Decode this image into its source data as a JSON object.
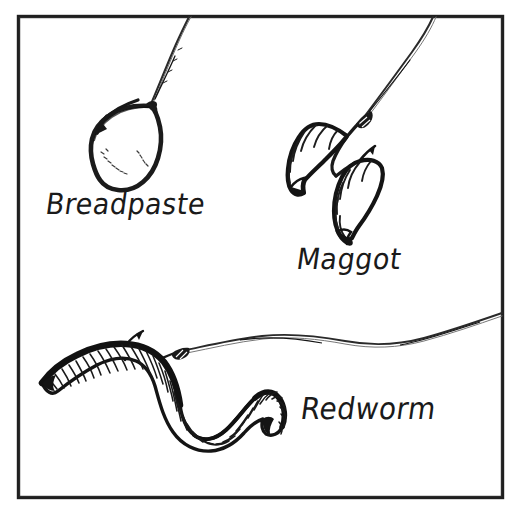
{
  "figure": {
    "background_color": "#ffffff",
    "ink_color": "#1a1a1a",
    "border": {
      "color": "#1f1f1f",
      "thickness_px": 3,
      "left": 18,
      "top": 16,
      "right": 502,
      "bottom": 497
    }
  },
  "labels": {
    "breadpaste": "Breadpaste",
    "maggot": "Maggot",
    "redworm": "Redworm"
  },
  "baits": [
    {
      "name": "breadpaste",
      "label": "Breadpaste",
      "description": "Teardrop-shaped ball of bread paste moulded onto a hook, fishing line rising to the top edge",
      "hook_visible": true
    },
    {
      "name": "maggot",
      "label": "Maggot",
      "description": "Two segmented maggot grubs threaded on a single hook, line rising to the top edge",
      "hook_visible": true
    },
    {
      "name": "redworm",
      "label": "Redworm",
      "description": "Segmented red worm in an S-curve pierced by a hook, line running off to the right edge",
      "hook_visible": true
    }
  ]
}
